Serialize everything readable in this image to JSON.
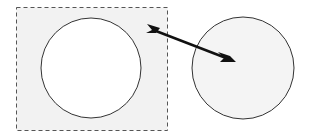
{
  "diagram": {
    "colors": {
      "background": "#ffffff",
      "box_fill": "#f2f2f2",
      "box_stroke": "#555555",
      "circle_fill_left": "#ffffff",
      "circle_fill_right": "#f4f4f4",
      "stroke": "#333333",
      "arrow": "#111111"
    },
    "shapes": {
      "selection_box": {
        "x": 16,
        "y": 7,
        "width": 151,
        "height": 123
      },
      "left_circle": {
        "cx": 91,
        "cy": 68,
        "r": 50
      },
      "right_circle": {
        "cx": 243,
        "cy": 68,
        "r": 51
      },
      "arrow": {
        "x1": 147,
        "y1": 28,
        "x2": 236,
        "y2": 62
      }
    }
  }
}
